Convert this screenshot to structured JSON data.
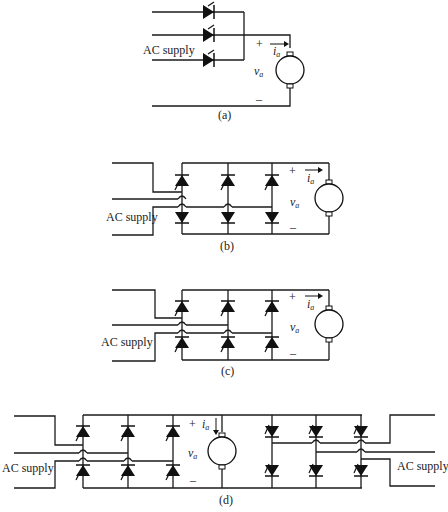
{
  "figures": [
    {
      "id": "a",
      "caption": "(a)",
      "supply_label": "AC supply",
      "description": "Three-phase half-wave controlled rectifier (3 thyristors) feeding DC motor",
      "plus": "+",
      "minus": "–",
      "current_label": "i",
      "current_sub": "a",
      "voltage_label": "v",
      "voltage_sub": "a"
    },
    {
      "id": "b",
      "caption": "(b)",
      "supply_label": "AC supply",
      "description": "Three-phase half-controlled bridge (3 thyristors top, 3 diodes bottom) feeding DC motor",
      "plus": "+",
      "minus": "–",
      "current_label": "i",
      "current_sub": "a",
      "voltage_label": "v",
      "voltage_sub": "a"
    },
    {
      "id": "c",
      "caption": "(c)",
      "supply_label": "AC supply",
      "description": "Three-phase fully-controlled bridge (6 thyristors) feeding DC motor",
      "plus": "+",
      "minus": "–",
      "current_label": "i",
      "current_sub": "a",
      "voltage_label": "v",
      "voltage_sub": "a"
    },
    {
      "id": "d",
      "caption": "(d)",
      "supply_label_left": "AC supply",
      "supply_label_right": "AC supply",
      "description": "Dual converter: two anti-parallel fully-controlled bridges feeding DC motor",
      "plus": "+",
      "minus": "–",
      "current_label": "i",
      "current_sub": "a",
      "voltage_label": "v",
      "voltage_sub": "a"
    }
  ]
}
